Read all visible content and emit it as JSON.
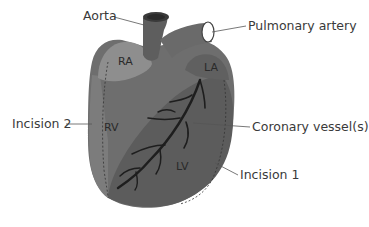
{
  "figure": {
    "type": "anatomical heart diagram",
    "colors": {
      "body": "#6e6e6e",
      "lv": "#5a5a5a",
      "ra": "#8e8e8e",
      "vessel": "#1e1e1e",
      "leader": "#555555",
      "text": "#3a3a3a"
    }
  },
  "labels": {
    "aorta": "Aorta",
    "pulmonary_artery": "Pulmonary artery",
    "incision_2": "Incision 2",
    "coronary_vessels": "Coronary vessel(s)",
    "incision_1": "Incision 1"
  },
  "regions": {
    "ra": "RA",
    "la": "LA",
    "rv": "RV",
    "lv": "LV"
  }
}
